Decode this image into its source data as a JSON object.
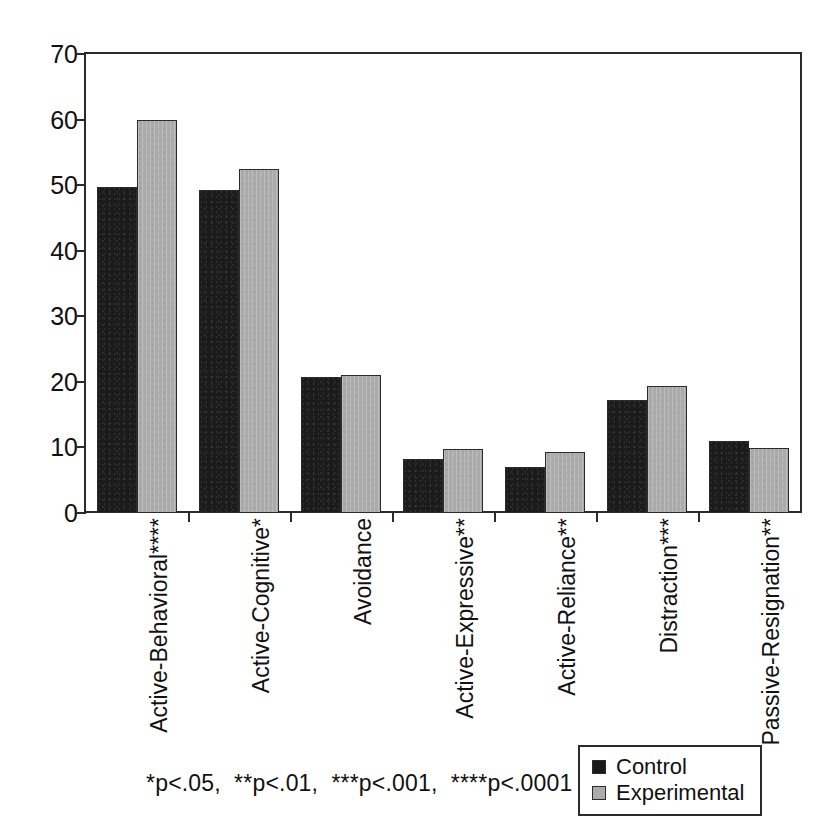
{
  "chart_data": {
    "type": "bar",
    "title": "",
    "xlabel": "",
    "ylabel": "",
    "ylim": [
      0,
      70
    ],
    "yticks": [
      0,
      10,
      20,
      30,
      40,
      50,
      60,
      70
    ],
    "grid": false,
    "legend_position": "bottom-right",
    "categories": [
      "Active-Behavioral****",
      "Active-Cognitive*",
      "Avoidance",
      "Active-Expressive**",
      "Active-Reliance**",
      "Distraction***",
      "Passive-Resignation**"
    ],
    "series": [
      {
        "name": "Control",
        "color": "#1b1b1b",
        "values": [
          49.7,
          49.3,
          20.8,
          8.3,
          7.0,
          17.2,
          11.0
        ]
      },
      {
        "name": "Experimental",
        "color": "#ababab",
        "values": [
          60.0,
          52.4,
          21.0,
          9.7,
          9.3,
          19.3,
          9.9
        ]
      }
    ],
    "annotation": "*p<.05,  **p<.01,  ***p<.001,  ****p<.0001"
  },
  "legend": {
    "items": [
      {
        "label": "Control",
        "swatch": "control"
      },
      {
        "label": "Experimental",
        "swatch": "experimental"
      }
    ]
  },
  "footnote": {
    "text": "*p<.05,  **p<.01,  ***p<.001,  ****p<.0001"
  },
  "axis": {
    "y_tick_labels": [
      "70",
      "60",
      "50",
      "40",
      "30",
      "20",
      "10",
      "0"
    ]
  }
}
